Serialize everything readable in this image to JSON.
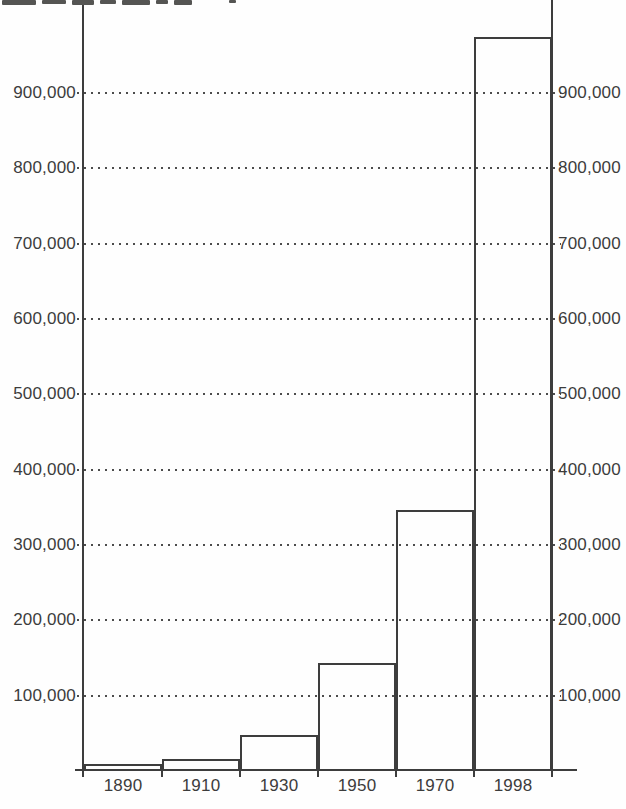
{
  "chart_data": {
    "type": "bar",
    "title": "",
    "xlabel": "",
    "ylabel": "",
    "categories": [
      "1890",
      "1910",
      "1930",
      "1950",
      "1970",
      "1998"
    ],
    "values": [
      9000,
      16000,
      48000,
      143000,
      346000,
      975000
    ],
    "ylim": [
      0,
      1025000
    ],
    "y_ticks": [
      100000,
      200000,
      300000,
      400000,
      500000,
      600000,
      700000,
      800000,
      900000
    ],
    "y_tick_labels": [
      "100,000",
      "200,000",
      "300,000",
      "400,000",
      "500,000",
      "600,000",
      "700,000",
      "800,000",
      "900,000"
    ],
    "grid": "horizontal-dotted",
    "legend": "none",
    "y_axis_labels_on_both_sides": true,
    "bar_fill": "transparent",
    "top_edge_cropped": true
  },
  "colors": {
    "ink": "#3d3d3d",
    "label_text": "#3c3c3c",
    "background": "#fefefe"
  }
}
